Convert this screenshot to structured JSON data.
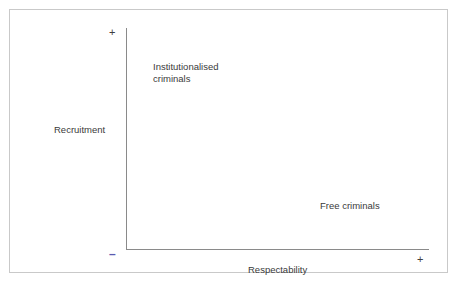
{
  "figure": {
    "type": "conceptual-quadrant-diagram",
    "background_color": "#ffffff",
    "frame_color": "#c9c9c9",
    "axis_color": "#8a8a8a",
    "text_color": "#3a3a3a",
    "minus_marker_color": "#5b5bb0"
  },
  "axes": {
    "y": {
      "title": "Recruitment",
      "positive_marker": "+",
      "negative_marker": "–"
    },
    "x": {
      "title": "Respectability",
      "positive_marker": "+",
      "negative_marker": "–"
    }
  },
  "chart_data": {
    "type": "scatter",
    "title": "",
    "xlabel": "Respectability",
    "ylabel": "Recruitment",
    "xlim": [
      "–",
      "+"
    ],
    "ylim": [
      "–",
      "+"
    ],
    "grid": false,
    "legend": "none",
    "annotations": [
      {
        "text": "Institutionalised criminals",
        "lines": [
          "Institutionalised",
          "criminals"
        ],
        "quadrant": "top-left",
        "x": "low-respectability",
        "y": "high-recruitment"
      },
      {
        "text": "Free criminals",
        "lines": [
          "Free criminals"
        ],
        "quadrant": "bottom-right",
        "x": "high-respectability",
        "y": "low-recruitment"
      }
    ]
  },
  "labels": {
    "institutionalised_criminals": "Institutionalised\ncriminals",
    "free_criminals": "Free criminals"
  }
}
